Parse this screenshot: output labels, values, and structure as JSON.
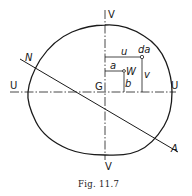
{
  "figure": {
    "caption": "Fig. 11.7",
    "labels": {
      "v_top": "V",
      "v_bottom": "V",
      "u_left": "U",
      "u_right": "U",
      "centroid": "G",
      "n": "N",
      "a_end": "A",
      "u": "u",
      "da": "da",
      "v": "v",
      "a": "a",
      "w": "W",
      "b": "b"
    },
    "colors": {
      "ink": "#1a1a1a",
      "background": "#ffffff"
    }
  }
}
